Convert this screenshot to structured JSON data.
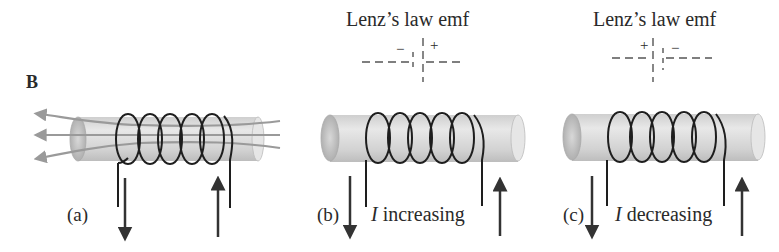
{
  "figure": {
    "field_label": "B",
    "panels": [
      {
        "id": "a",
        "label": "(a)",
        "caption_symbol": "",
        "caption_text": "",
        "lenz_title": "",
        "has_field_lines": true
      },
      {
        "id": "b",
        "label": "(b)",
        "caption_symbol": "I",
        "caption_text": " increasing",
        "lenz_title": "Lenz’s law emf",
        "battery_left_sign": "−",
        "battery_right_sign": "+"
      },
      {
        "id": "c",
        "label": "(c)",
        "caption_symbol": "I",
        "caption_text": " decreasing",
        "lenz_title": "Lenz’s law emf",
        "battery_left_sign": "+",
        "battery_right_sign": "−"
      }
    ],
    "colors": {
      "coil": "#1e1e1e",
      "rod_light": "#e4e4e4",
      "rod_dark": "#b8b8b8",
      "field_lines": "#9a9a9a",
      "arrows": "#333333",
      "dashes": "#555555"
    }
  }
}
